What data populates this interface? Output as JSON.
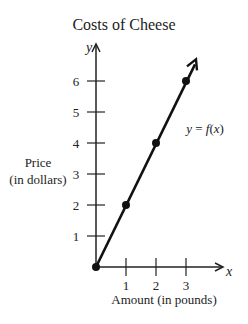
{
  "chart_data": {
    "type": "line",
    "title": "Costs of Cheese",
    "xlabel": "Amount (in pounds)",
    "ylabel": "Price (in dollars)",
    "ylabel_lines": [
      "Price",
      "(in dollars)"
    ],
    "x_axis_letter": "x",
    "y_axis_letter": "y",
    "x_ticks": [
      1,
      2,
      3
    ],
    "y_ticks": [
      1,
      2,
      3,
      4,
      5,
      6
    ],
    "xlim": [
      0,
      3.4
    ],
    "ylim": [
      0,
      6.5
    ],
    "grid": false,
    "series": [
      {
        "name": "y = f(x)",
        "label_parts": {
          "lhs": "y",
          "eq": " = ",
          "fn": "f",
          "arg": "x"
        },
        "points": [
          [
            0,
            0
          ],
          [
            1,
            2
          ],
          [
            2,
            4
          ],
          [
            3,
            6
          ]
        ],
        "x": [
          0,
          1,
          2,
          3
        ],
        "values": [
          0,
          2,
          4,
          6
        ],
        "extends_with_arrow": true
      }
    ]
  }
}
